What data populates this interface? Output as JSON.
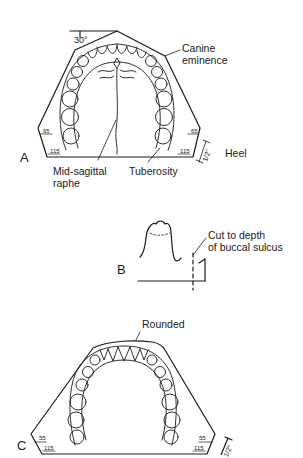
{
  "figure": {
    "panel_a": {
      "letter": "A",
      "angle_label": "30°",
      "labels": {
        "canine_line1": "Canine",
        "canine_line2": "eminence",
        "raphe_line1": "Mid-sagittal",
        "raphe_line2": "raphe",
        "tuberosity": "Tuberosity",
        "heel": "Heel"
      },
      "measurements": {
        "left_side": "65",
        "right_side": "65",
        "left_base": "115",
        "right_base": "115",
        "heel_height": "1/2\""
      }
    },
    "panel_b": {
      "letter": "B",
      "labels": {
        "cut_line1": "Cut to depth",
        "cut_line2": "of buccal sulcus"
      }
    },
    "panel_c": {
      "letter": "C",
      "labels": {
        "rounded": "Rounded"
      },
      "measurements": {
        "left_side": "55",
        "right_side": "55",
        "left_base": "115",
        "right_base": "115",
        "heel_height": "1/2\""
      }
    }
  }
}
